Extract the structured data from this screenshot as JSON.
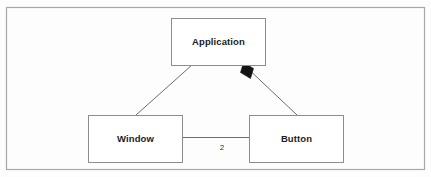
{
  "diagram": {
    "type": "uml-class-diagram",
    "background_color": "#fdfdfd",
    "frame": {
      "name": "diagram-frame",
      "x": 6.5,
      "y": 7.5,
      "width": 418,
      "height": 162,
      "stroke_color": "#a8a8a8"
    },
    "nodes": [
      {
        "id": "application",
        "label": "Application",
        "x": 171,
        "y": 18,
        "width": 94,
        "height": 47,
        "fill_color": "#ffffff",
        "stroke_color": "#8d8d8d"
      },
      {
        "id": "window",
        "label": "Window",
        "x": 88,
        "y": 115,
        "width": 94,
        "height": 47,
        "fill_color": "#ffffff",
        "stroke_color": "#8d8d8d"
      },
      {
        "id": "button",
        "label": "Button",
        "x": 249,
        "y": 115,
        "width": 94,
        "height": 47,
        "fill_color": "#ffffff",
        "stroke_color": "#8d8d8d"
      }
    ],
    "edges": [
      {
        "id": "application-window",
        "kind": "association",
        "from": "application",
        "to": "window",
        "x1": 192,
        "y1": 65,
        "x2": 136,
        "y2": 115,
        "stroke_color": "#6e6e6e",
        "end_marker": "none",
        "multiplicity": ""
      },
      {
        "id": "application-button",
        "kind": "composition",
        "from": "application",
        "to": "button",
        "x1": 244,
        "y1": 65,
        "x2": 297,
        "y2": 115,
        "stroke_color": "#6e6e6e",
        "end_marker": "filled-diamond",
        "marker_color": "#141414",
        "multiplicity": ""
      },
      {
        "id": "window-button",
        "kind": "association",
        "from": "window",
        "to": "button",
        "x1": 182,
        "y1": 137.5,
        "x2": 249,
        "y2": 137.5,
        "stroke_color": "#6e6e6e",
        "end_marker": "none",
        "multiplicity": "2"
      }
    ],
    "multiplicity_labels": [
      {
        "id": "window-button-multiplicity",
        "text": "2",
        "x": 222,
        "y": 148
      }
    ]
  }
}
